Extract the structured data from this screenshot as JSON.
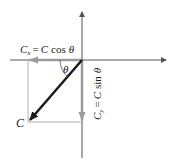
{
  "diagram": {
    "vector_label": "C",
    "angle_label": "θ",
    "x_component": {
      "symbol": "C",
      "subscript": "x",
      "equals": "=",
      "expr_var": "C",
      "func": "cos",
      "angle": "θ"
    },
    "y_component": {
      "symbol": "C",
      "subscript": "y",
      "equals": "=",
      "expr_var": "C",
      "func": "sin",
      "angle": "θ"
    },
    "colors": {
      "axes": "#555555",
      "vector": "#1a1a1a",
      "component": "#9a9a9a",
      "guide": "#b0b0b0"
    }
  }
}
